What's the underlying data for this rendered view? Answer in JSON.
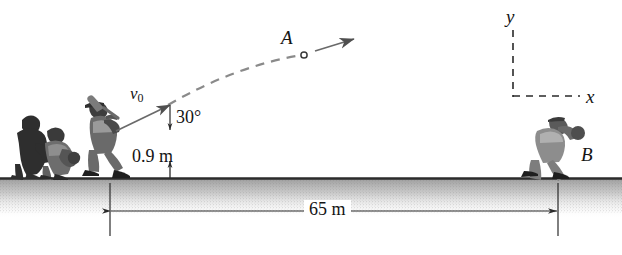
{
  "figure": {
    "background_color": "#ffffff",
    "ink_color": "#141414",
    "ground_color": "#8c8c8c",
    "trajectory_color": "#8a8a8a"
  },
  "labels": {
    "point_a": "A",
    "point_b": "B",
    "axis_y": "y",
    "axis_x": "x",
    "initial_velocity": "v",
    "initial_velocity_subscript": "0",
    "launch_angle": "30°",
    "launch_height": "0.9 m",
    "horizontal_distance": "65 m"
  },
  "physics": {
    "launch_angle_degrees": 30,
    "launch_height_meters": 0.9,
    "horizontal_distance_meters": 65
  },
  "figures": {
    "umpire": "umpire-figure",
    "catcher": "catcher-figure",
    "batter": "batter-figure",
    "fielder": "fielder-figure"
  },
  "icons": {
    "ball": "ball-icon",
    "velocity_arrow": "velocity-arrow-icon",
    "trajectory": "trajectory-path-icon",
    "height_dimension": "height-dimension-icon",
    "distance_dimension": "distance-dimension-icon",
    "axes": "coordinate-axes-icon"
  }
}
